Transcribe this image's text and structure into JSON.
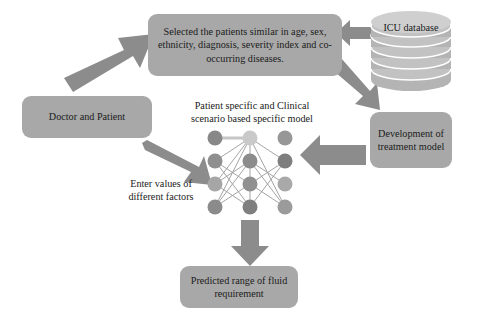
{
  "diagram": {
    "background_color": "#ffffff",
    "shape_fill_color": "#a8a8a8",
    "arrow_fill_color": "#8c8c8c",
    "text_color": "#1b1b1b"
  },
  "nodes": {
    "selected_patients": {
      "label": "Selected the patients similar in age, sex, ethnicity, diagnosis, severity index and co-occurring diseases.",
      "shape": "rounded-rectangle"
    },
    "doctor_patient": {
      "label": "Doctor and Patient",
      "shape": "rounded-rectangle"
    },
    "icu_database": {
      "label": "ICU database",
      "shape": "cylinder-database",
      "disk_count": 6
    },
    "development_model": {
      "label": "Development of treatment model",
      "shape": "rounded-rectangle"
    },
    "model_title": {
      "label": "Patient specific and Clinical scenario based specific model",
      "shape": "plain-text"
    },
    "enter_values": {
      "label": "Enter values of different factors",
      "shape": "plain-text"
    },
    "predicted_range": {
      "label": "Predicted range of fluid requirement",
      "shape": "rounded-rectangle"
    },
    "neural_network": {
      "label": "neural network diagram",
      "shape": "node-graph",
      "columns": 3,
      "rows": 4,
      "node_count": 12
    }
  },
  "arrows": [
    {
      "name": "doctor-to-selected",
      "direction": "up-right",
      "from": "doctor_patient",
      "to": "selected_patients"
    },
    {
      "name": "icu-to-selected",
      "direction": "left",
      "from": "icu_database",
      "to": "selected_patients"
    },
    {
      "name": "selected-to-development",
      "direction": "down-right",
      "from": "selected_patients",
      "to": "development_model"
    },
    {
      "name": "development-to-network",
      "direction": "left",
      "from": "development_model",
      "to": "neural_network"
    },
    {
      "name": "doctor-to-network",
      "direction": "down-right",
      "from": "doctor_patient",
      "to": "neural_network"
    },
    {
      "name": "network-to-predicted",
      "direction": "down",
      "from": "neural_network",
      "to": "predicted_range"
    }
  ]
}
